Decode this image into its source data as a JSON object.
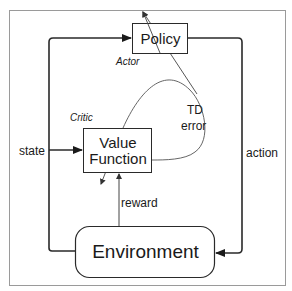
{
  "diagram": {
    "nodes": {
      "policy": {
        "label": "Policy",
        "role_label": "Actor"
      },
      "value_function": {
        "label_line1": "Value",
        "label_line2": "Function",
        "role_label": "Critic"
      },
      "environment": {
        "label": "Environment"
      }
    },
    "edges": {
      "state": "state",
      "action": "action",
      "reward": "reward",
      "td_error_line1": "TD",
      "td_error_line2": "error"
    },
    "colors": {
      "stroke": "#2a2a2a",
      "thin_stroke": "#555555",
      "border": "#9a9a9a",
      "background": "#ffffff"
    }
  }
}
